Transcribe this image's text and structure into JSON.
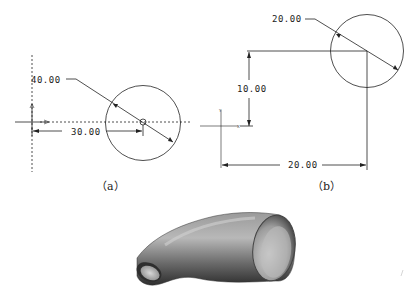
{
  "figure_a": {
    "caption": "（a）",
    "diameter_dim": "40.00",
    "offset_dim": "30.00",
    "axis_label_y": "Y",
    "axis_label_x": "X"
  },
  "figure_b": {
    "caption": "（b）",
    "diameter_dim": "20.00",
    "vertical_dim": "10.00",
    "horizontal_dim": "20.00",
    "axis_label_y": "Y",
    "axis_label_x": "X"
  },
  "figure_c": {
    "description": "3D swept pipe elbow (shaded tube)"
  },
  "colors": {
    "line": "#222222",
    "background": "#ffffff",
    "pipe_light": "#bdbdbd",
    "pipe_dark": "#3a3a3a"
  }
}
